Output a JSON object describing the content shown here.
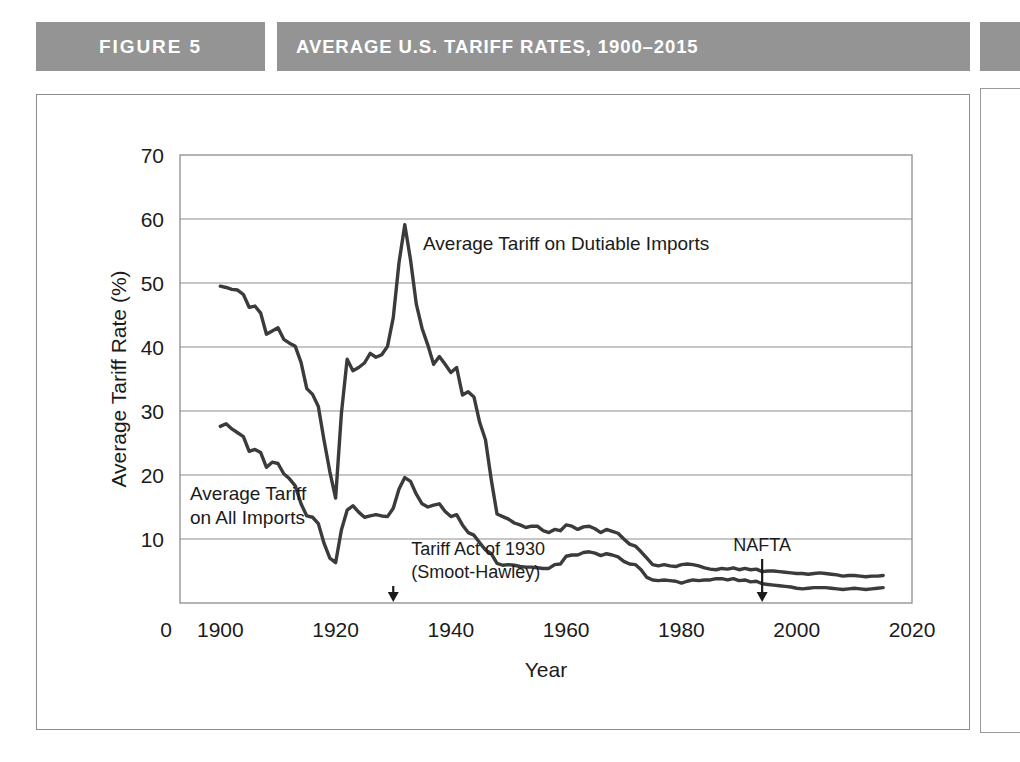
{
  "figure": {
    "tag_label": "FIGURE 5",
    "title": "AVERAGE U.S. TARIFF RATES, 1900–2015",
    "banner_color": "#949494",
    "banner_text_color": "#ffffff",
    "frame_color": "#8d8d8d"
  },
  "chart_data": {
    "type": "line",
    "title": "AVERAGE U.S. TARIFF RATES, 1900–2015",
    "xlabel": "Year",
    "ylabel": "Average Tariff Rate (%)",
    "xlim": [
      1893,
      2020
    ],
    "ylim": [
      0,
      70
    ],
    "xticks": [
      1900,
      1920,
      1940,
      1960,
      1980,
      2000,
      2020
    ],
    "xtick_labels": [
      "1900",
      "1920",
      "1940",
      "1960",
      "1980",
      "2000",
      "2020"
    ],
    "x_origin_label": "0",
    "yticks": [
      10,
      20,
      30,
      40,
      50,
      60,
      70
    ],
    "ytick_labels": [
      "10",
      "20",
      "30",
      "40",
      "50",
      "60",
      "70"
    ],
    "grid": "horizontal",
    "grid_color": "#8d8d8d",
    "line_color": "#3b3b3b",
    "line_width": 3.4,
    "legend": "inline-labels",
    "series": [
      {
        "name": "Average Tariff on Dutiable Imports",
        "label_position": "inside-right-of-peak",
        "x": [
          1900,
          1901,
          1902,
          1903,
          1904,
          1905,
          1906,
          1907,
          1908,
          1909,
          1910,
          1911,
          1912,
          1913,
          1914,
          1915,
          1916,
          1917,
          1918,
          1919,
          1920,
          1921,
          1922,
          1923,
          1924,
          1925,
          1926,
          1927,
          1928,
          1929,
          1930,
          1931,
          1932,
          1933,
          1934,
          1935,
          1936,
          1937,
          1938,
          1939,
          1940,
          1941,
          1942,
          1943,
          1944,
          1945,
          1946,
          1947,
          1948,
          1949,
          1950,
          1951,
          1952,
          1953,
          1954,
          1955,
          1956,
          1957,
          1958,
          1959,
          1960,
          1961,
          1962,
          1963,
          1964,
          1965,
          1966,
          1967,
          1968,
          1969,
          1970,
          1971,
          1972,
          1973,
          1974,
          1975,
          1976,
          1977,
          1978,
          1979,
          1980,
          1981,
          1982,
          1983,
          1984,
          1985,
          1986,
          1987,
          1988,
          1989,
          1990,
          1991,
          1992,
          1993,
          1994,
          1995,
          1996,
          1997,
          1998,
          1999,
          2000,
          2001,
          2002,
          2003,
          2004,
          2005,
          2006,
          2007,
          2008,
          2009,
          2010,
          2011,
          2012,
          2013,
          2014,
          2015
        ],
        "y": [
          49.5,
          49.3,
          49.0,
          48.9,
          48.2,
          46.2,
          46.4,
          45.3,
          42.0,
          42.5,
          43.0,
          41.2,
          40.6,
          40.1,
          37.6,
          33.5,
          32.6,
          30.7,
          25.4,
          20.5,
          16.4,
          29.6,
          38.1,
          36.3,
          36.8,
          37.5,
          39.0,
          38.4,
          38.8,
          40.1,
          44.6,
          53.2,
          59.1,
          53.6,
          46.7,
          42.9,
          40.3,
          37.3,
          38.5,
          37.3,
          36.0,
          36.8,
          32.5,
          33.0,
          32.2,
          28.2,
          25.5,
          19.3,
          13.9,
          13.5,
          13.1,
          12.5,
          12.2,
          11.8,
          12.0,
          12.0,
          11.3,
          11.0,
          11.5,
          11.3,
          12.2,
          12.0,
          11.5,
          11.9,
          12.0,
          11.6,
          11.0,
          11.5,
          11.2,
          10.9,
          10.0,
          9.2,
          8.9,
          8.0,
          7.0,
          6.0,
          5.8,
          6.0,
          5.8,
          5.7,
          6.0,
          6.1,
          6.0,
          5.8,
          5.5,
          5.3,
          5.2,
          5.4,
          5.3,
          5.5,
          5.2,
          5.4,
          5.2,
          5.3,
          4.9,
          5.0,
          5.0,
          4.9,
          4.8,
          4.7,
          4.6,
          4.6,
          4.5,
          4.6,
          4.7,
          4.6,
          4.5,
          4.4,
          4.2,
          4.3,
          4.3,
          4.2,
          4.1,
          4.2,
          4.2,
          4.3
        ]
      },
      {
        "name": "Average Tariff on All Imports",
        "label_position": "left-mid",
        "x": [
          1900,
          1901,
          1902,
          1903,
          1904,
          1905,
          1906,
          1907,
          1908,
          1909,
          1910,
          1911,
          1912,
          1913,
          1914,
          1915,
          1916,
          1917,
          1918,
          1919,
          1920,
          1921,
          1922,
          1923,
          1924,
          1925,
          1926,
          1927,
          1928,
          1929,
          1930,
          1931,
          1932,
          1933,
          1934,
          1935,
          1936,
          1937,
          1938,
          1939,
          1940,
          1941,
          1942,
          1943,
          1944,
          1945,
          1946,
          1947,
          1948,
          1949,
          1950,
          1951,
          1952,
          1953,
          1954,
          1955,
          1956,
          1957,
          1958,
          1959,
          1960,
          1961,
          1962,
          1963,
          1964,
          1965,
          1966,
          1967,
          1968,
          1969,
          1970,
          1971,
          1972,
          1973,
          1974,
          1975,
          1976,
          1977,
          1978,
          1979,
          1980,
          1981,
          1982,
          1983,
          1984,
          1985,
          1986,
          1987,
          1988,
          1989,
          1990,
          1991,
          1992,
          1993,
          1994,
          1995,
          1996,
          1997,
          1998,
          1999,
          2000,
          2001,
          2002,
          2003,
          2004,
          2005,
          2006,
          2007,
          2008,
          2009,
          2010,
          2011,
          2012,
          2013,
          2014,
          2015
        ],
        "y": [
          27.6,
          28.0,
          27.2,
          26.6,
          26.0,
          23.7,
          24.0,
          23.5,
          21.2,
          22.0,
          21.8,
          20.2,
          19.4,
          18.3,
          15.5,
          13.6,
          13.4,
          12.4,
          9.3,
          7.0,
          6.3,
          11.4,
          14.5,
          15.2,
          14.2,
          13.4,
          13.6,
          13.8,
          13.6,
          13.5,
          14.8,
          17.8,
          19.6,
          19.0,
          17.0,
          15.5,
          15.0,
          15.3,
          15.5,
          14.3,
          13.5,
          13.8,
          12.2,
          11.0,
          10.6,
          9.4,
          8.3,
          7.7,
          6.2,
          5.9,
          6.0,
          5.9,
          5.7,
          5.6,
          5.6,
          5.5,
          5.4,
          5.4,
          6.0,
          6.1,
          7.3,
          7.5,
          7.5,
          7.9,
          8.0,
          7.8,
          7.4,
          7.7,
          7.5,
          7.2,
          6.5,
          6.1,
          6.0,
          5.2,
          4.0,
          3.6,
          3.5,
          3.6,
          3.5,
          3.4,
          3.1,
          3.4,
          3.6,
          3.5,
          3.6,
          3.6,
          3.8,
          3.8,
          3.6,
          3.8,
          3.5,
          3.6,
          3.3,
          3.4,
          3.0,
          2.9,
          2.8,
          2.7,
          2.6,
          2.5,
          2.3,
          2.2,
          2.3,
          2.4,
          2.4,
          2.4,
          2.3,
          2.2,
          2.1,
          2.2,
          2.3,
          2.2,
          2.1,
          2.2,
          2.3,
          2.4
        ]
      }
    ],
    "annotations": [
      {
        "text_line1": "Tariff Act of 1930",
        "text_line2": "(Smoot-Hawley)",
        "arrow_year": 1930,
        "arrow": "down-to-axis"
      },
      {
        "text_line1": "NAFTA",
        "text_line2": "",
        "arrow_year": 1994,
        "arrow": "down-to-axis"
      }
    ]
  }
}
